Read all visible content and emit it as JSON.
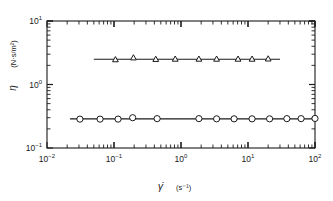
{
  "chart_data": {
    "type": "line",
    "title": "",
    "xlabel": "γ̇ (s⁻¹)",
    "ylabel": "η (N·s/m²)",
    "xscale": "log",
    "yscale": "log",
    "xlim": [
      0.01,
      100
    ],
    "ylim": [
      0.1,
      10
    ],
    "grid": false,
    "legend": "none",
    "xticklabels": [
      "10⁻²",
      "10⁻¹",
      "10⁰",
      "10¹",
      "10²"
    ],
    "xtickvalues": [
      0.01,
      0.1,
      1,
      10,
      100
    ],
    "yticklabels": [
      "10⁻¹",
      "10⁰",
      "10¹"
    ],
    "ytickvalues": [
      0.1,
      1,
      10
    ],
    "series": [
      {
        "name": "upper-series",
        "marker": "triangle",
        "x": [
          0.105,
          0.195,
          0.42,
          0.82,
          1.85,
          3.4,
          7.1,
          11.5,
          20.0
        ],
        "y": [
          2.45,
          2.62,
          2.48,
          2.5,
          2.5,
          2.5,
          2.5,
          2.5,
          2.52
        ],
        "line_x_start": 0.05,
        "line_x_end": 30.0,
        "line_y": 2.5
      },
      {
        "name": "lower-series",
        "marker": "circle",
        "x": [
          0.031,
          0.062,
          0.115,
          0.19,
          0.44,
          1.85,
          3.4,
          6.2,
          11.5,
          21.0,
          38.0,
          62.0,
          100.0
        ],
        "y": [
          0.285,
          0.285,
          0.285,
          0.3,
          0.29,
          0.29,
          0.288,
          0.288,
          0.288,
          0.288,
          0.29,
          0.29,
          0.292
        ],
        "line_x_start": 0.022,
        "line_x_end": 105.0,
        "line_y": 0.288
      }
    ]
  },
  "axes": {
    "x_title_symbol": "γ̇",
    "x_title_unit": "(s⁻¹)",
    "y_title_symbol": "η",
    "y_title_unit": "(N·s/m²)"
  },
  "colors": {
    "ink": "#1a1a1a",
    "background": "#ffffff",
    "marker_fill": "#ffffff"
  }
}
